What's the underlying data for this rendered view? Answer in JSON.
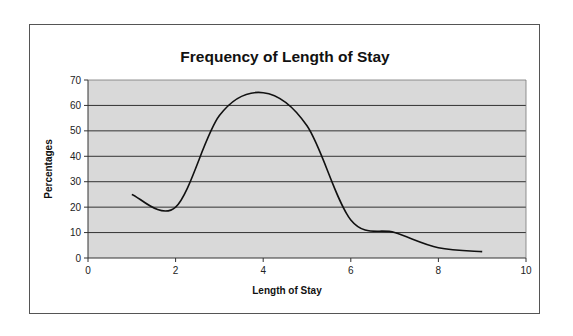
{
  "chart_data": {
    "type": "line",
    "title": "Frequency of Length of Stay",
    "xlabel": "Length of Stay",
    "ylabel": "Percentages",
    "x": [
      1,
      2,
      3,
      4,
      5,
      6,
      7,
      8,
      9
    ],
    "series": [
      {
        "name": "Percentages",
        "values": [
          25,
          20,
          56,
          65,
          52,
          15,
          10,
          4,
          2.5
        ]
      }
    ],
    "xlim": [
      0,
      10
    ],
    "ylim": [
      0,
      70
    ],
    "x_ticks": [
      0,
      2,
      4,
      6,
      8,
      10
    ],
    "y_ticks": [
      0,
      10,
      20,
      30,
      40,
      50,
      60,
      70
    ],
    "smoothed": true,
    "grid": {
      "horizontal": true,
      "vertical": false
    },
    "legend": "none",
    "colors": {
      "plot_background": "#d9d9d9",
      "line": "#111111",
      "gridline": "#333333"
    }
  }
}
